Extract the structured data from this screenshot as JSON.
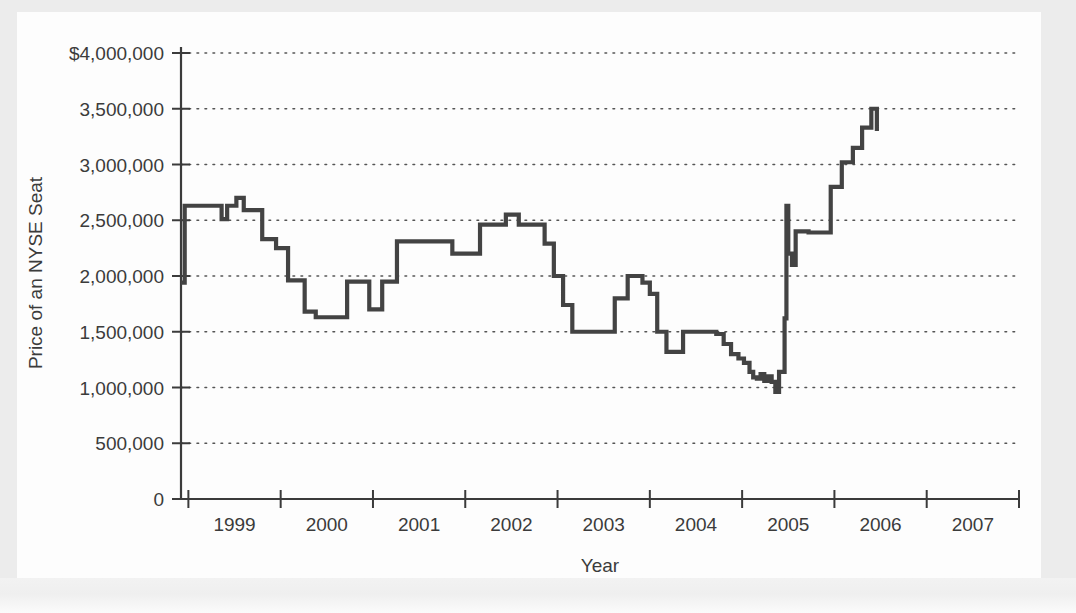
{
  "chart_data": {
    "type": "line",
    "title": "",
    "xlabel": "Year",
    "ylabel": "Price of an NYSE Seat",
    "grid": true,
    "legend": false,
    "line_color": "#434343",
    "xlim": [
      1998.42,
      2007.5
    ],
    "ylim": [
      0,
      4000000
    ],
    "x_ticks": [
      1998.5,
      1999.5,
      2000.5,
      2001.5,
      2002.5,
      2003.5,
      2004.5,
      2005.5,
      2006.5,
      2007.5
    ],
    "x_tick_labels": [
      "1999",
      "2000",
      "2001",
      "2002",
      "2003",
      "2004",
      "2005",
      "2006",
      "2007"
    ],
    "y_ticks": [
      0,
      500000,
      1000000,
      1500000,
      2000000,
      2500000,
      3000000,
      3500000,
      4000000
    ],
    "y_tick_labels": [
      "0",
      "500,000",
      "1,000,000",
      "1,500,000",
      "2,000,000",
      "2,500,000",
      "3,000,000",
      "3,500,000",
      "$4,000,000"
    ],
    "series": [
      {
        "name": "Price of an NYSE Seat",
        "step": "post",
        "x": [
          1998.42,
          1998.46,
          1998.7,
          1998.86,
          1998.92,
          1999.02,
          1999.1,
          1999.18,
          1999.3,
          1999.45,
          1999.58,
          1999.66,
          1999.76,
          1999.88,
          2000.02,
          2000.1,
          2000.22,
          2000.34,
          2000.46,
          2000.6,
          2000.76,
          2001.1,
          2001.36,
          2001.52,
          2001.66,
          2001.8,
          2001.94,
          2002.08,
          2002.22,
          2002.36,
          2002.46,
          2002.56,
          2002.66,
          2002.78,
          2002.96,
          2003.12,
          2003.26,
          2003.34,
          2003.42,
          2003.5,
          2003.58,
          2003.68,
          2003.86,
          2004.02,
          2004.12,
          2004.22,
          2004.3,
          2004.38,
          2004.46,
          2004.52,
          2004.58,
          2004.62,
          2004.66,
          2004.7,
          2004.74,
          2004.78,
          2004.82,
          2004.86,
          2004.9,
          2004.94,
          2004.96,
          2004.98,
          2005.0,
          2005.04,
          2005.08,
          2005.14,
          2005.22,
          2005.34,
          2005.46,
          2005.58,
          2005.7,
          2005.8,
          2005.9,
          2005.96
        ],
        "y": [
          1940000,
          2630000,
          2630000,
          2510000,
          2630000,
          2700000,
          2590000,
          2590000,
          2330000,
          2250000,
          1960000,
          1960000,
          1680000,
          1630000,
          1630000,
          1630000,
          1950000,
          1950000,
          1700000,
          1950000,
          2310000,
          2310000,
          2200000,
          2200000,
          2460000,
          2460000,
          2550000,
          2460000,
          2460000,
          2290000,
          2000000,
          1740000,
          1500000,
          1500000,
          1500000,
          1800000,
          2000000,
          2000000,
          1940000,
          1840000,
          1500000,
          1320000,
          1500000,
          1500000,
          1500000,
          1480000,
          1390000,
          1300000,
          1260000,
          1220000,
          1140000,
          1090000,
          1080000,
          1120000,
          1060000,
          1100000,
          1050000,
          960000,
          1140000,
          1140000,
          1620000,
          2630000,
          2200000,
          2100000,
          2400000,
          2400000,
          2390000,
          2390000,
          2800000,
          3020000,
          3150000,
          3330000,
          3500000,
          3300000
        ]
      }
    ]
  },
  "axes": {
    "x_axis_name": "x-axis",
    "y_axis_name": "y-axis"
  }
}
